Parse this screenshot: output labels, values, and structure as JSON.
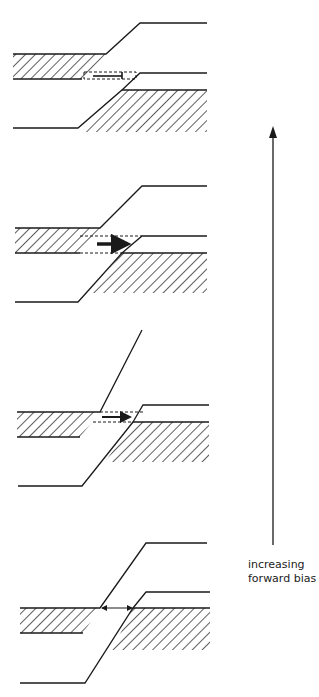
{
  "diagram": {
    "type": "band-diagram-sequence",
    "axis_label_line1": "increasing",
    "axis_label_line2": "forward bias",
    "stroke_color": "#1a1a1a",
    "panels": [
      {
        "index": 1,
        "position": "top",
        "arrow_style": "thin-with-bar",
        "tunneling": "none"
      },
      {
        "index": 2,
        "position": "second",
        "arrow_style": "thick",
        "tunneling": "peak"
      },
      {
        "index": 3,
        "position": "third",
        "arrow_style": "medium",
        "tunneling": "partial"
      },
      {
        "index": 4,
        "position": "bottom",
        "arrow_style": "double-headed-thin",
        "tunneling": "small"
      }
    ]
  }
}
